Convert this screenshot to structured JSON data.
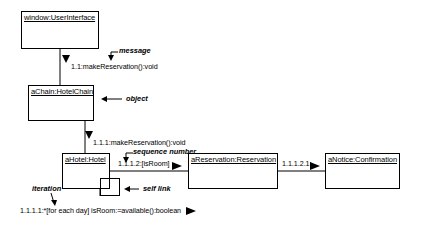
{
  "diagram": {
    "type": "uml-communication-diagram",
    "objects": [
      {
        "id": "window",
        "label": "window:UserInterface"
      },
      {
        "id": "chain",
        "label": "aChain:HotelChain"
      },
      {
        "id": "hotel",
        "label": "aHotel:Hotel"
      },
      {
        "id": "reservation",
        "label": "aReservation:Reservation"
      },
      {
        "id": "notice",
        "label": "aNotice:Confirmation"
      }
    ],
    "messages": [
      {
        "id": "m1",
        "text": "1.1:makeReservation():void"
      },
      {
        "id": "m2",
        "text": "1.1.1:makeReservation():void"
      },
      {
        "id": "m3",
        "text": "1.1.1.2:[isRoom]"
      },
      {
        "id": "m4",
        "text": "1.1.1.2.1:"
      },
      {
        "id": "m5",
        "text": "1.1.1.1:*[for each day] isRoom:=available():boolean"
      }
    ],
    "annotations": [
      {
        "id": "a1",
        "text": "message"
      },
      {
        "id": "a2",
        "text": "object"
      },
      {
        "id": "a3",
        "text": "sequence number"
      },
      {
        "id": "a4",
        "text": "self link"
      },
      {
        "id": "a5",
        "text": "iteration"
      }
    ],
    "colors": {
      "line": "#000000",
      "background": "#ffffff",
      "text": "#000000"
    }
  }
}
